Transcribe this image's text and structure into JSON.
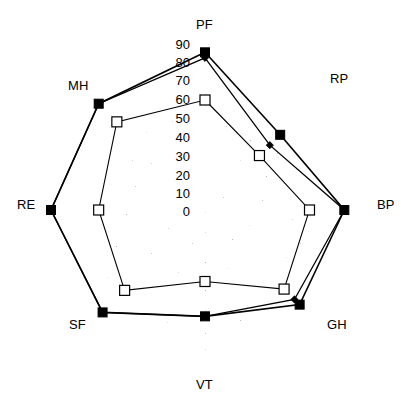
{
  "chart_data": {
    "type": "radar",
    "title": "",
    "subtitle": "",
    "xlabel": "",
    "ylabel": "",
    "categories": [
      "PF",
      "RP",
      "BP",
      "GH",
      "VT",
      "SF",
      "RE",
      "MH"
    ],
    "category_angles_deg": [
      90,
      45,
      0,
      -45,
      -90,
      -135,
      180,
      135
    ],
    "tick_values": [
      0,
      10,
      20,
      30,
      40,
      50,
      60,
      70,
      80,
      90
    ],
    "tick_labels": [
      "0",
      "10",
      "20",
      "30",
      "40",
      "50",
      "60",
      "70",
      "80",
      "90"
    ],
    "tick_axis": "PF",
    "rlim": [
      0,
      90
    ],
    "grid": false,
    "legend": "none",
    "series": [
      {
        "name": "series-open-square",
        "marker": "open-square",
        "marker_fill": "#ffffff",
        "marker_stroke": "#000000",
        "line_color": "#000000",
        "line_width": 1.1,
        "values": [
          60,
          42,
          57,
          61,
          39,
          62,
          58,
          68
        ]
      },
      {
        "name": "series-filled-square",
        "marker": "filled-square",
        "marker_fill": "#000000",
        "marker_stroke": "#000000",
        "line_color": "#000000",
        "line_width": 1.6,
        "values": [
          86,
          58,
          76,
          73,
          58,
          79,
          84,
          82
        ]
      },
      {
        "name": "series-diamond",
        "marker": "diamond",
        "marker_fill": "#000000",
        "marker_stroke": "#000000",
        "line_color": "#000000",
        "line_width": 1.3,
        "values": [
          83,
          50,
          76,
          69,
          58,
          79,
          84,
          82
        ]
      }
    ]
  },
  "axis_labels": {
    "PF": "PF",
    "RP": "RP",
    "BP": "BP",
    "GH": "GH",
    "VT": "VT",
    "SF": "SF",
    "RE": "RE",
    "MH": "MH"
  },
  "ticks": {
    "t0": "0",
    "t10": "10",
    "t20": "20",
    "t30": "30",
    "t40": "40",
    "t50": "50",
    "t60": "60",
    "t70": "70",
    "t80": "80",
    "t90": "90"
  },
  "colors": {
    "ink": "#000000",
    "background": "#ffffff",
    "marker_open_fill": "#ffffff"
  }
}
